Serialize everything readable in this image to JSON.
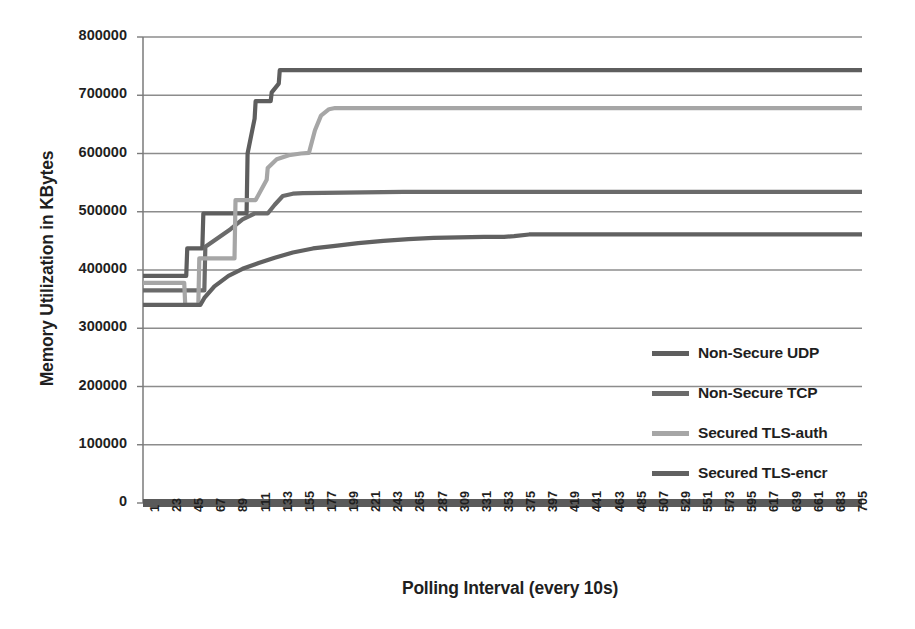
{
  "chart_data": {
    "type": "line",
    "title": "",
    "xlabel": "Polling Interval (every 10s)",
    "ylabel": "Memory Utilization in KBytes",
    "ylim": [
      0,
      800000
    ],
    "ytick_values": [
      0,
      100000,
      200000,
      300000,
      400000,
      500000,
      600000,
      700000,
      800000
    ],
    "ytick_labels": [
      "0",
      "100000",
      "200000",
      "300000",
      "400000",
      "500000",
      "600000",
      "700000",
      "800000"
    ],
    "xtick_labels": [
      "1",
      "23",
      "45",
      "67",
      "89",
      "111",
      "133",
      "155",
      "177",
      "199",
      "221",
      "243",
      "265",
      "287",
      "309",
      "331",
      "353",
      "375",
      "397",
      "419",
      "441",
      "463",
      "485",
      "507",
      "529",
      "551",
      "573",
      "595",
      "617",
      "639",
      "661",
      "683",
      "705"
    ],
    "x_start": 1,
    "x_end": 716,
    "grid": true,
    "legend_position": "inside-right",
    "series": [
      {
        "name": "Non-Secure UDP",
        "color": "#5e5e5e",
        "x": [
          1,
          30,
          44,
          45,
          60,
          61,
          86,
          87,
          104,
          105,
          112,
          113,
          128,
          129,
          136,
          137,
          716
        ],
        "y": [
          390000,
          390000,
          390000,
          437000,
          437000,
          497000,
          497000,
          497000,
          497000,
          600000,
          660000,
          690000,
          690000,
          705000,
          720000,
          743000,
          743000
        ]
      },
      {
        "name": "Non-Secure TCP",
        "color": "#6b6b6b",
        "x": [
          1,
          42,
          43,
          62,
          63,
          88,
          100,
          112,
          124,
          125,
          132,
          140,
          150,
          160,
          200,
          260,
          300,
          340,
          716
        ],
        "y": [
          365000,
          365000,
          365000,
          365000,
          440000,
          470000,
          487000,
          497000,
          497000,
          497000,
          512000,
          527000,
          531000,
          532000,
          533000,
          534000,
          534000,
          534000,
          534000
        ]
      },
      {
        "name": "Secured TLS-auth",
        "color": "#a6a6a6",
        "x": [
          1,
          42,
          43,
          56,
          57,
          70,
          71,
          92,
          93,
          112,
          113,
          124,
          125,
          134,
          146,
          158,
          166,
          172,
          178,
          186,
          192,
          716
        ],
        "y": [
          378000,
          378000,
          340000,
          340000,
          420000,
          420000,
          420000,
          420000,
          520000,
          520000,
          520000,
          555000,
          575000,
          590000,
          597000,
          600000,
          601000,
          640000,
          665000,
          676000,
          678000,
          678000
        ]
      },
      {
        "name": "Secured TLS-encr",
        "color": "#616161",
        "x": [
          1,
          44,
          45,
          58,
          62,
          72,
          86,
          100,
          116,
          132,
          150,
          170,
          190,
          215,
          240,
          265,
          290,
          315,
          340,
          360,
          370,
          385,
          420,
          480,
          560,
          640,
          716
        ],
        "y": [
          340000,
          340000,
          340000,
          340000,
          352000,
          372000,
          390000,
          402000,
          412000,
          421000,
          430000,
          437000,
          441000,
          446000,
          450000,
          453000,
          455000,
          456000,
          457000,
          457000,
          458000,
          461000,
          461000,
          461000,
          461000,
          461000,
          461000
        ]
      }
    ]
  },
  "legend": {
    "items": [
      {
        "label": "Non-Secure UDP",
        "color": "#5e5e5e"
      },
      {
        "label": "Non-Secure TCP",
        "color": "#6b6b6b"
      },
      {
        "label": "Secured TLS-auth",
        "color": "#a6a6a6"
      },
      {
        "label": "Secured TLS-encr",
        "color": "#616161"
      }
    ]
  },
  "style": {
    "grid_color": "#8c8c8c",
    "axis_color": "#7a7a7a",
    "baseline_color": "#5a5a5a",
    "text_color": "#1f1f1f",
    "background": "#ffffff"
  }
}
